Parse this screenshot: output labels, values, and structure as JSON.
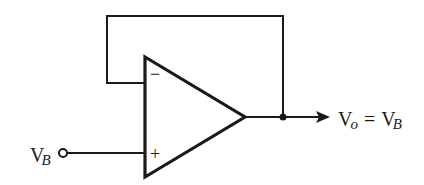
{
  "diagram": {
    "type": "circuit",
    "colors": {
      "stroke": "#1a1a1a",
      "background": "#ffffff"
    },
    "components": [
      {
        "id": "opamp",
        "kind": "op-amp",
        "inputs": [
          "-",
          "+"
        ]
      },
      {
        "id": "input-terminal",
        "kind": "open-circle-terminal"
      },
      {
        "id": "output-node",
        "kind": "junction-dot"
      }
    ],
    "pins": {
      "inverting": "−",
      "non_inverting": "+"
    },
    "labels": {
      "input": {
        "main": "V",
        "sub": "B"
      },
      "output": {
        "main": "V",
        "sub": "o",
        "eq": "=",
        "rhs_main": "V",
        "rhs_sub": "B"
      }
    },
    "connections": [
      "output-node → feedback loop → inverting input (−)",
      "input-terminal V_B → non-inverting input (+)",
      "opamp output → output-node → arrow to V_o"
    ]
  }
}
